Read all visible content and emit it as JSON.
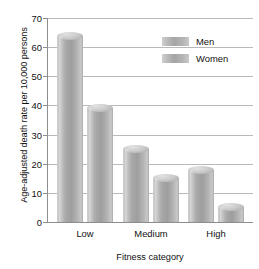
{
  "chart_data": {
    "type": "bar",
    "title": "",
    "subtitle": "",
    "xlabel": "Fitness category",
    "ylabel": "Age-adjusted death rate per 10,000 persons",
    "categories": [
      "Low",
      "Medium",
      "High"
    ],
    "series": [
      {
        "name": "Men",
        "values": [
          64,
          25,
          18
        ]
      },
      {
        "name": "Women",
        "values": [
          39,
          15,
          5
        ]
      }
    ],
    "ylim": [
      0,
      70
    ],
    "yticks": [
      0,
      10,
      20,
      30,
      40,
      50,
      60,
      70
    ],
    "ytick_labels": [
      "0",
      "10",
      "20",
      "30",
      "40",
      "50",
      "60",
      "70"
    ],
    "grid": true,
    "legend_position": "top-right",
    "annotations": [],
    "colors": {
      "bar_light": "#cfcfcf",
      "bar_mid": "#a5a5a5",
      "bar_dark": "#9e9e9e",
      "gridline": "#b9b9b9",
      "axis": "#8e8e8e",
      "text": "#111111",
      "background": "#ffffff"
    }
  },
  "legend": {
    "items": [
      {
        "label": "Men"
      },
      {
        "label": "Women"
      }
    ]
  }
}
